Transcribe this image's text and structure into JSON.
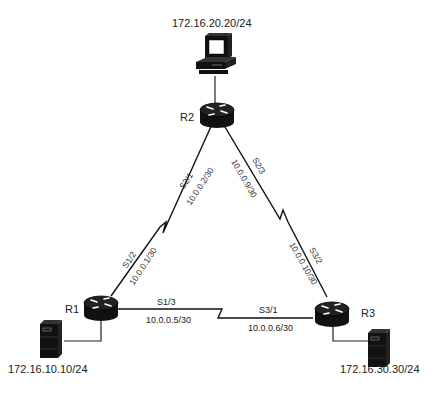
{
  "diagram": {
    "type": "network-topology",
    "devices": [
      {
        "id": "pc",
        "kind": "workstation",
        "icon": "computer-icon",
        "address": "172.16.20.20/24"
      },
      {
        "id": "R2",
        "kind": "router",
        "icon": "router-icon",
        "label": "R2"
      },
      {
        "id": "R1",
        "kind": "router",
        "icon": "router-icon",
        "label": "R1"
      },
      {
        "id": "R3",
        "kind": "router",
        "icon": "router-icon",
        "label": "R3"
      },
      {
        "id": "srv1",
        "kind": "server",
        "icon": "server-icon",
        "address": "172.16.10.10/24"
      },
      {
        "id": "srv3",
        "kind": "server",
        "icon": "server-icon",
        "address": "172.16.30.30/24"
      }
    ],
    "links": {
      "r1_r2": {
        "type": "serial",
        "r1_iface": "S1/2",
        "r1_ip": "10.0.0.1/30",
        "r2_iface": "S2/1",
        "r2_ip": "10.0.0.2/30"
      },
      "r2_r3": {
        "type": "serial",
        "r2_iface": "S2/3",
        "r2_ip": "10.0.0.9/30",
        "r3_iface": "S3/2",
        "r3_ip": "10.0.0.10/30"
      },
      "r1_r3": {
        "type": "serial",
        "r1_iface": "S1/3",
        "r1_ip": "10.0.0.5/30",
        "r3_iface": "S3/1",
        "r3_ip": "10.0.0.6/30"
      }
    },
    "labels": {
      "pc_address": "172.16.20.20/24",
      "srv1_address": "172.16.10.10/24",
      "srv3_address": "172.16.30.30/24",
      "r1": "R1",
      "r2": "R2",
      "r3": "R3"
    }
  }
}
